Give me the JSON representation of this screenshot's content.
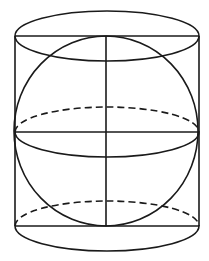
{
  "diagram": {
    "title": "",
    "colors": {
      "line": "#1a1a1a",
      "background": "#ffffff"
    },
    "cylinder": {
      "left_x": 15,
      "right_x": 199,
      "top_y": 36,
      "bottom_y": 226,
      "ellipse_ry": 25
    },
    "sphere": {
      "cx": 106,
      "cy": 132,
      "r": 93
    },
    "equator": {
      "cy": 132,
      "ry": 25
    },
    "labels": []
  }
}
